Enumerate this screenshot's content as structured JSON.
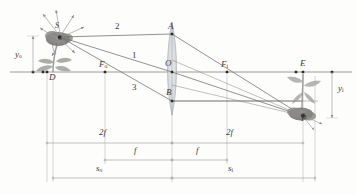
{
  "figure": {
    "type": "optics-ray-diagram",
    "background_color": "#fdfdfc",
    "axis_color": "#8f8f8f",
    "ray_color": "#6e6e6e",
    "dimension_color": "#a8a8a8",
    "lens_color": "#b9bcc0",
    "label_color": "#3a3a3a",
    "plant_color": "#9a9a98",
    "flower_color": "#7d7b79"
  },
  "points": [
    {
      "id": "S",
      "label": "S",
      "sub": "",
      "x": 60,
      "y": 37,
      "dot": true
    },
    {
      "id": "D",
      "label": "D",
      "sub": "",
      "x": 47,
      "y": 72,
      "dot": true
    },
    {
      "id": "Fo",
      "label": "F",
      "sub": "o",
      "x": 105,
      "y": 72,
      "dot": true
    },
    {
      "id": "O",
      "label": "O",
      "sub": "",
      "x": 172,
      "y": 72,
      "dot": true
    },
    {
      "id": "A",
      "label": "A",
      "sub": "",
      "x": 172,
      "y": 34,
      "dot": true
    },
    {
      "id": "B",
      "label": "B",
      "sub": "",
      "x": 172,
      "y": 101,
      "dot": true
    },
    {
      "id": "Fi",
      "label": "F",
      "sub": "i",
      "x": 227,
      "y": 72,
      "dot": true
    },
    {
      "id": "E",
      "label": "E",
      "sub": "",
      "x": 303,
      "y": 72,
      "dot": true
    },
    {
      "id": "P",
      "label": "P",
      "sub": "",
      "x": 303,
      "y": 116,
      "dot": true
    }
  ],
  "rays": [
    {
      "id": "ray1",
      "label": "1",
      "label_x": 134,
      "label_y": 55,
      "desc": "chief ray through lens center O",
      "path": [
        [
          60,
          37
        ],
        [
          172,
          72
        ],
        [
          303,
          116
        ]
      ]
    },
    {
      "id": "ray2",
      "label": "2",
      "label_x": 117,
      "label_y": 27,
      "desc": "parallel ray to A then through Fi",
      "path": [
        [
          60,
          37
        ],
        [
          172,
          34
        ],
        [
          303,
          116
        ]
      ]
    },
    {
      "id": "ray3",
      "label": "3",
      "label_x": 134,
      "label_y": 88,
      "desc": "ray through object focal point Fo to B then parallel",
      "path": [
        [
          60,
          37
        ],
        [
          172,
          101
        ],
        [
          303,
          101
        ]
      ]
    }
  ],
  "dimensions": [
    {
      "id": "twof-left",
      "label": "2f",
      "x1": 47,
      "x2": 172,
      "y": 143,
      "label_x": 103,
      "label_y": 131
    },
    {
      "id": "twof-right",
      "label": "2f",
      "x1": 172,
      "x2": 303,
      "y": 143,
      "label_x": 230,
      "label_y": 131
    },
    {
      "id": "f-left",
      "label": "f",
      "x1": 105,
      "x2": 172,
      "y": 160,
      "label_x": 136,
      "label_y": 149
    },
    {
      "id": "f-right",
      "label": "f",
      "x1": 172,
      "x2": 227,
      "y": 160,
      "label_x": 198,
      "label_y": 149
    },
    {
      "id": "so",
      "label": "s",
      "sub": "o",
      "x1": 53,
      "x2": 172,
      "y": 178,
      "label_x": 100,
      "label_y": 167
    },
    {
      "id": "si",
      "label": "s",
      "sub": "i",
      "x1": 172,
      "x2": 315,
      "y": 178,
      "label_x": 231,
      "label_y": 167
    }
  ],
  "heights": [
    {
      "id": "yo",
      "label": "y",
      "sub": "o",
      "x": 33,
      "y_top": 38,
      "y_bottom": 72,
      "label_x": 19,
      "label_y": 55,
      "direction": "up"
    },
    {
      "id": "yi",
      "label": "y",
      "sub": "i",
      "x": 332,
      "y_top": 72,
      "y_bottom": 116,
      "label_x": 340,
      "label_y": 90,
      "direction": "down"
    }
  ],
  "axis": {
    "id": "optical-axis",
    "y": 72,
    "x1": 10,
    "x2": 352
  },
  "lens": {
    "id": "converging-lens",
    "center_x": 172,
    "top_y": 22,
    "bottom_y": 115,
    "bulge": 5
  },
  "object": {
    "id": "object-flower",
    "name": "upright-flower",
    "base_x": 47,
    "base_y": 72,
    "head_x": 60,
    "head_y": 37
  },
  "image": {
    "id": "image-flower",
    "name": "inverted-flower",
    "base_x": 303,
    "base_y": 72,
    "head_x": 303,
    "head_y": 116
  }
}
